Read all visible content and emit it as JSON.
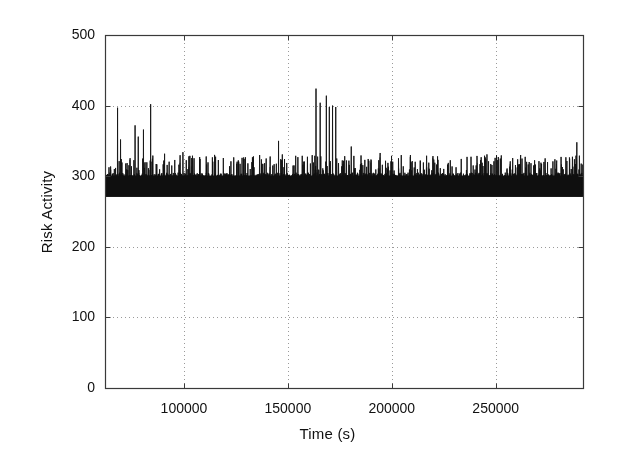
{
  "figure": {
    "name": "risk-activity-time-series",
    "background_color": "#ffffff",
    "ink_color": "#101010",
    "grid_color": "#9a9a9a",
    "frame_color": "#3a3a3a",
    "width": 617,
    "height": 459
  },
  "chart_data": {
    "type": "line",
    "title": "",
    "subtitle": "",
    "xlabel": "Time (s)",
    "ylabel": "Risk Activity",
    "xlim": [
      62000,
      292000
    ],
    "ylim": [
      0,
      500
    ],
    "xticks": [
      100000,
      150000,
      200000,
      250000
    ],
    "xtick_labels": [
      "100000",
      "150000",
      "200000",
      "250000"
    ],
    "yticks": [
      0,
      100,
      200,
      300,
      400,
      500
    ],
    "ytick_labels": [
      "0",
      "100",
      "200",
      "300",
      "400",
      "500"
    ],
    "grid": true,
    "grid_style": "dotted",
    "legend": null,
    "legend_position": "none",
    "series_name": "Risk Activity",
    "line_color": "#101010",
    "line_width": 0.7,
    "baseline_band": [
      272,
      305
    ],
    "common_spike_ceiling": 330,
    "notable_spikes": [
      {
        "x": 68000,
        "y": 397
      },
      {
        "x": 69500,
        "y": 352
      },
      {
        "x": 72000,
        "y": 318
      },
      {
        "x": 76500,
        "y": 372
      },
      {
        "x": 78000,
        "y": 356
      },
      {
        "x": 80500,
        "y": 366
      },
      {
        "x": 84000,
        "y": 402
      },
      {
        "x": 99500,
        "y": 334
      },
      {
        "x": 128000,
        "y": 326
      },
      {
        "x": 145500,
        "y": 350
      },
      {
        "x": 163500,
        "y": 424
      },
      {
        "x": 165500,
        "y": 404
      },
      {
        "x": 168500,
        "y": 414
      },
      {
        "x": 170000,
        "y": 398
      },
      {
        "x": 171500,
        "y": 400
      },
      {
        "x": 173000,
        "y": 398
      },
      {
        "x": 180500,
        "y": 342
      },
      {
        "x": 209000,
        "y": 330
      },
      {
        "x": 262000,
        "y": 330
      },
      {
        "x": 289000,
        "y": 348
      }
    ],
    "sampling": {
      "points": 2400,
      "note": "Trace is reconstructed procedurally from the baseline band, periodic spike ceiling and the listed notable spikes."
    }
  },
  "plot_geometry": {
    "left": 105,
    "right": 583,
    "top": 35,
    "bottom": 388
  }
}
